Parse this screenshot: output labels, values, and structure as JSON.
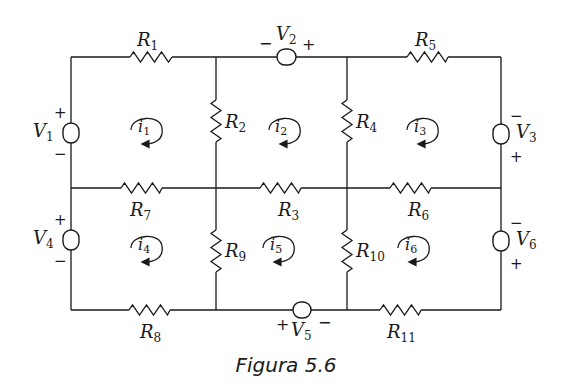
{
  "figure": {
    "caption": "Figura 5.6"
  },
  "resistors": {
    "R1": {
      "name": "R",
      "sub": "1"
    },
    "R2": {
      "name": "R",
      "sub": "2"
    },
    "R3": {
      "name": "R",
      "sub": "3"
    },
    "R4": {
      "name": "R",
      "sub": "4"
    },
    "R5": {
      "name": "R",
      "sub": "5"
    },
    "R6": {
      "name": "R",
      "sub": "6"
    },
    "R7": {
      "name": "R",
      "sub": "7"
    },
    "R8": {
      "name": "R",
      "sub": "8"
    },
    "R9": {
      "name": "R",
      "sub": "9"
    },
    "R10": {
      "name": "R",
      "sub": "10"
    },
    "R11": {
      "name": "R",
      "sub": "11"
    }
  },
  "sources": {
    "V1": {
      "name": "V",
      "sub": "1",
      "plus": "+",
      "minus": "−"
    },
    "V2": {
      "name": "V",
      "sub": "2",
      "plus": "+",
      "minus": "−"
    },
    "V3": {
      "name": "V",
      "sub": "3",
      "plus": "+",
      "minus": "−"
    },
    "V4": {
      "name": "V",
      "sub": "4",
      "plus": "+",
      "minus": "−"
    },
    "V5": {
      "name": "V",
      "sub": "5",
      "plus": "+",
      "minus": "−"
    },
    "V6": {
      "name": "V",
      "sub": "6",
      "plus": "+",
      "minus": "−"
    }
  },
  "mesh_currents": {
    "i1": {
      "name": "i",
      "sub": "1",
      "direction": "clockwise"
    },
    "i2": {
      "name": "i",
      "sub": "2",
      "direction": "clockwise"
    },
    "i3": {
      "name": "i",
      "sub": "3",
      "direction": "clockwise"
    },
    "i4": {
      "name": "i",
      "sub": "4",
      "direction": "clockwise"
    },
    "i5": {
      "name": "i",
      "sub": "5",
      "direction": "clockwise"
    },
    "i6": {
      "name": "i",
      "sub": "6",
      "direction": "clockwise"
    }
  }
}
